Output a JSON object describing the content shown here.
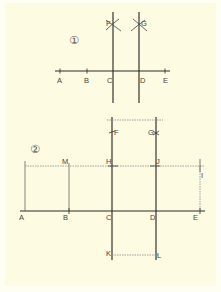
{
  "figure1": {
    "number": "①",
    "points": {
      "A": "A",
      "B": "B",
      "C": "C",
      "D": "D",
      "E": "E",
      "F": "F",
      "G": "G"
    }
  },
  "figure2": {
    "number": "②",
    "points": {
      "A": "A",
      "B": "B",
      "C": "C",
      "D": "D",
      "E": "E",
      "F": "F",
      "G": "G",
      "H": "H",
      "J": "J",
      "M": "M",
      "I": "I",
      "K": "K",
      "L": "L"
    }
  },
  "colors": {
    "background": "#fdfbe2",
    "line": "#2a2a2a",
    "dotted": "#8a8a8a",
    "label": "#444444"
  }
}
